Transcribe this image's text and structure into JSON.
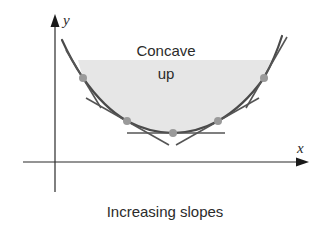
{
  "diagram": {
    "axis_labels": {
      "x": "x",
      "y": "y"
    },
    "region_label_line1": "Concave",
    "region_label_line2": "up",
    "caption": "Increasing slopes",
    "colors": {
      "axis": "#2b2b2b",
      "curve": "#4a4a4a",
      "tangent": "#555555",
      "shade": "#e6e6e6",
      "point": "#9a9a9a",
      "text": "#2b2b2b"
    },
    "tangent_points": [
      {
        "x": 83,
        "y": 78
      },
      {
        "x": 127,
        "y": 121
      },
      {
        "x": 173,
        "y": 133
      },
      {
        "x": 218,
        "y": 121
      },
      {
        "x": 264,
        "y": 78
      }
    ]
  }
}
